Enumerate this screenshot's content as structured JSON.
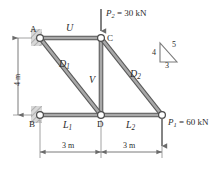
{
  "figure": {
    "background_color": "#ffffff",
    "member_color": "#9a9a9a",
    "member_edge_color": "#555555",
    "line_color": "#555555",
    "text_color": "#2b2b2b"
  },
  "nodes": [
    {
      "id": "A",
      "label": "A",
      "x": 40,
      "y": 38,
      "support": "wall-hatched"
    },
    {
      "id": "C",
      "label": "C",
      "x": 101,
      "y": 38,
      "support": "none"
    },
    {
      "id": "B",
      "label": "B",
      "x": 40,
      "y": 115,
      "support": "wall-hatched"
    },
    {
      "id": "D",
      "label": "D",
      "x": 101,
      "y": 115,
      "support": "none"
    },
    {
      "id": "E",
      "label": "",
      "x": 162,
      "y": 115,
      "support": "none"
    }
  ],
  "members": [
    {
      "id": "U",
      "label": "U",
      "sub": "",
      "from": "A",
      "to": "C"
    },
    {
      "id": "D1",
      "label": "D",
      "sub": "1",
      "from": "A",
      "to": "D"
    },
    {
      "id": "V",
      "label": "V",
      "sub": "",
      "from": "C",
      "to": "D"
    },
    {
      "id": "D2",
      "label": "D",
      "sub": "2",
      "from": "C",
      "to": "E"
    },
    {
      "id": "L1",
      "label": "L",
      "sub": "1",
      "from": "B",
      "to": "D"
    },
    {
      "id": "L2",
      "label": "L",
      "sub": "2",
      "from": "D",
      "to": "E"
    }
  ],
  "loads": [
    {
      "id": "P2",
      "symbol": "P",
      "sub": "2",
      "equals": "=",
      "value": "30",
      "unit": "kN",
      "text": "P2 = 30 kN",
      "at_node": "C",
      "direction": "down"
    },
    {
      "id": "P1",
      "symbol": "P",
      "sub": "1",
      "equals": "=",
      "value": "60",
      "unit": "kN",
      "text": "P1 = 60 kN",
      "at_node": "E",
      "direction": "down"
    }
  ],
  "dimensions": [
    {
      "id": "height",
      "text": "4 m",
      "orientation": "vertical",
      "from": "A",
      "to": "B"
    },
    {
      "id": "span1",
      "text": "3 m",
      "orientation": "horizontal",
      "from": "B",
      "to": "D"
    },
    {
      "id": "span2",
      "text": "3 m",
      "orientation": "horizontal",
      "from": "D",
      "to": "E"
    }
  ],
  "slope_triangle": {
    "id": "slope-triangle",
    "vertical": "4",
    "hypotenuse": "5",
    "horizontal": "3"
  }
}
